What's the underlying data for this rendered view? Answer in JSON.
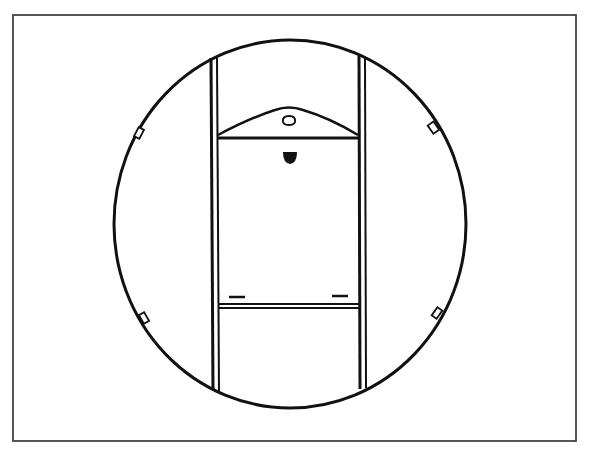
{
  "figure": {
    "colors": {
      "ink": "#111111",
      "frame": "#444444",
      "background": "#ffffff"
    },
    "frame": {
      "x": 13,
      "y": 15,
      "width": 563,
      "height": 426
    },
    "circle": {
      "cx": 290,
      "cy": 224,
      "rx": 176,
      "ry": 184
    },
    "rails": [
      {
        "name": "left",
        "x": 214,
        "y1": 58,
        "y2": 393
      },
      {
        "name": "right",
        "x": 362,
        "y1": 56,
        "y2": 392
      }
    ],
    "crossbars": [
      {
        "name": "top",
        "y": 138
      },
      {
        "name": "bottom",
        "y": 307
      }
    ],
    "bracket": {
      "peak_y": 107,
      "base_y": 136,
      "hole": "keyhole",
      "notch": "semicircle"
    },
    "slots": [
      {
        "x": 237,
        "y": 297
      },
      {
        "x": 340,
        "y": 297
      }
    ],
    "clips": [
      {
        "side": "left-top",
        "x": 140,
        "y": 133
      },
      {
        "side": "left-bottom",
        "x": 145,
        "y": 318
      },
      {
        "side": "right-top",
        "x": 434,
        "y": 128
      },
      {
        "side": "right-bottom",
        "x": 437,
        "y": 313
      }
    ]
  }
}
